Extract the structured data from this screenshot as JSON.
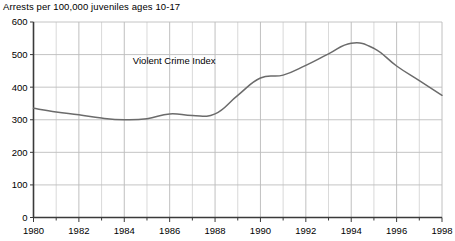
{
  "chart_data": {
    "type": "line",
    "title": "Arrests per 100,000 juveniles ages 10-17",
    "xlabel": "",
    "ylabel": "",
    "xlim": [
      1980,
      1998
    ],
    "ylim": [
      0,
      600
    ],
    "grid": true,
    "legend_position": "inline-annotation",
    "annotations": [
      {
        "text": "Violent Crime Index",
        "x": 1986.2,
        "y": 470
      }
    ],
    "xticks": [
      1980,
      1982,
      1984,
      1986,
      1988,
      1990,
      1992,
      1994,
      1996,
      1998
    ],
    "xtick_labels": [
      "1980",
      "1982",
      "1984",
      "1986",
      "1988",
      "1990",
      "1992",
      "1994",
      "1996",
      "1998"
    ],
    "xticks_minor": [
      1981,
      1983,
      1985,
      1987,
      1989,
      1991,
      1993,
      1995,
      1997
    ],
    "yticks": [
      0,
      100,
      200,
      300,
      400,
      500,
      600
    ],
    "ytick_labels": [
      "0",
      "100",
      "200",
      "300",
      "400",
      "500",
      "600"
    ],
    "series": [
      {
        "name": "Violent Crime Index",
        "color": "#6b6b6b",
        "x": [
          1980,
          1981,
          1982,
          1983,
          1984,
          1985,
          1986,
          1987,
          1988,
          1989,
          1990,
          1991,
          1992,
          1993,
          1994,
          1995,
          1996,
          1997,
          1998
        ],
        "values": [
          335,
          324,
          315,
          305,
          300,
          303,
          318,
          313,
          318,
          375,
          428,
          437,
          467,
          502,
          535,
          519,
          465,
          420,
          375
        ]
      }
    ]
  },
  "axis": {
    "x_label_row": [
      "1980",
      "1982",
      "1984",
      "1986",
      "1988",
      "1990",
      "1992",
      "1994",
      "1996",
      "1998"
    ],
    "y_label_col": [
      "600",
      "500",
      "400",
      "300",
      "200",
      "100",
      "0"
    ]
  }
}
